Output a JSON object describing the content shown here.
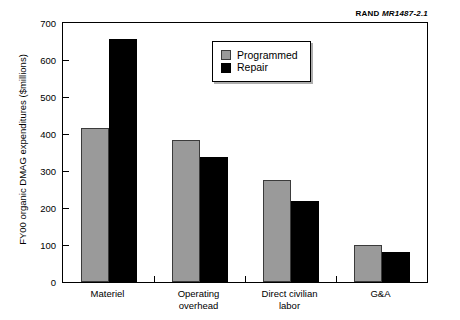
{
  "credit": {
    "brand": "RAND",
    "report": "MR1487-2.1"
  },
  "legend": {
    "position": "top-right-inside",
    "items": [
      {
        "label": "Programmed",
        "color": "#9a9a9a"
      },
      {
        "label": "Repair",
        "color": "#000000"
      }
    ]
  },
  "chart_data": {
    "type": "bar",
    "title": "",
    "xlabel": "",
    "ylabel": "FY00 organic DMAG expenditures ($millions)",
    "categories": [
      "Materiel",
      "Operating\noverhead",
      "Direct civilian\nlabor",
      "G&A"
    ],
    "series": [
      {
        "name": "Programmed",
        "color": "#9a9a9a",
        "values": [
          415,
          385,
          277,
          99
        ]
      },
      {
        "name": "Repair",
        "color": "#000000",
        "values": [
          658,
          337,
          218,
          80
        ]
      }
    ],
    "ylim": [
      0,
      700
    ],
    "yticks": [
      0,
      100,
      200,
      300,
      400,
      500,
      600,
      700
    ],
    "ytick_labels": [
      "0",
      "100",
      "200",
      "300",
      "400",
      "500",
      "600",
      "700"
    ],
    "grid": false,
    "legend_position": "upper right"
  }
}
